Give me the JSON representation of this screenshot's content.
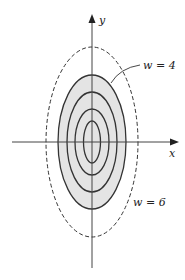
{
  "figure": {
    "axes": {
      "x_label": "x",
      "y_label": "y"
    },
    "labels": {
      "inner_region": "w = 4",
      "outer_curve": "w = 6"
    },
    "colors": {
      "stroke": "#333333",
      "shade": "#e4e4e4",
      "background": "#ffffff"
    },
    "contours": [
      {
        "rx": 8.5,
        "ry": 21,
        "style": "solid"
      },
      {
        "rx": 17,
        "ry": 33,
        "style": "solid"
      },
      {
        "rx": 25,
        "ry": 50,
        "style": "solid"
      },
      {
        "rx": 34,
        "ry": 67,
        "style": "solid",
        "shaded": true,
        "level": "w = 4"
      },
      {
        "rx": 46,
        "ry": 95,
        "style": "dashed",
        "level": "w = 6"
      }
    ]
  }
}
